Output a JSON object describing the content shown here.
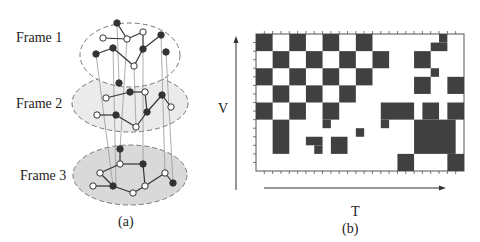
{
  "panel_a": {
    "caption": "(a)",
    "frames": [
      {
        "label": "Frame 1",
        "ellipse": {
          "cx": 130,
          "cy": 55,
          "rx": 50,
          "ry": 32
        },
        "fill": "#ffffff",
        "nodes": [
          [
            117,
            23,
            1
          ],
          [
            103,
            38,
            0
          ],
          [
            127,
            39,
            0
          ],
          [
            143,
            32,
            0
          ],
          [
            161,
            35,
            1
          ],
          [
            96,
            54,
            1
          ],
          [
            113,
            48,
            1
          ],
          [
            143,
            49,
            1
          ],
          [
            134,
            66,
            0
          ],
          [
            166,
            52,
            1
          ]
        ],
        "edges": [
          [
            0,
            2
          ],
          [
            1,
            2
          ],
          [
            2,
            3
          ],
          [
            3,
            7
          ],
          [
            7,
            4
          ],
          [
            5,
            6
          ],
          [
            6,
            8
          ],
          [
            8,
            7
          ]
        ]
      },
      {
        "label": "Frame 2",
        "ellipse": {
          "cx": 130,
          "cy": 103,
          "rx": 58,
          "ry": 29
        },
        "fill": "#ebebeb",
        "nodes": [
          [
            119,
            83,
            1
          ],
          [
            106,
            98,
            0
          ],
          [
            130,
            92,
            1
          ],
          [
            145,
            92,
            0
          ],
          [
            162,
            95,
            1
          ],
          [
            171,
            107,
            0
          ],
          [
            97,
            115,
            0
          ],
          [
            116,
            115,
            1
          ],
          [
            147,
            112,
            1
          ],
          [
            136,
            127,
            0
          ]
        ],
        "edges": [
          [
            1,
            2
          ],
          [
            2,
            3
          ],
          [
            3,
            8
          ],
          [
            8,
            9
          ],
          [
            9,
            7
          ],
          [
            7,
            6
          ],
          [
            8,
            4
          ],
          [
            4,
            5
          ]
        ]
      },
      {
        "label": "Frame 3",
        "ellipse": {
          "cx": 130,
          "cy": 175,
          "rx": 57,
          "ry": 30
        },
        "fill": "#d9d9d9",
        "nodes": [
          [
            120,
            149,
            1
          ],
          [
            120,
            164,
            0
          ],
          [
            143,
            164,
            1
          ],
          [
            100,
            173,
            0
          ],
          [
            165,
            173,
            0
          ],
          [
            145,
            186,
            0
          ],
          [
            173,
            183,
            1
          ],
          [
            93,
            186,
            0
          ],
          [
            113,
            186,
            1
          ],
          [
            133,
            193,
            0
          ]
        ],
        "edges": [
          [
            0,
            1
          ],
          [
            1,
            2
          ],
          [
            1,
            3
          ],
          [
            2,
            5
          ],
          [
            5,
            4
          ],
          [
            4,
            6
          ],
          [
            7,
            8
          ],
          [
            8,
            9
          ],
          [
            9,
            5
          ],
          [
            3,
            8
          ]
        ]
      }
    ],
    "links": [
      [
        96,
        54,
        113,
        186
      ],
      [
        113,
        48,
        116,
        186
      ],
      [
        127,
        39,
        120,
        149
      ],
      [
        143,
        49,
        143,
        164
      ],
      [
        161,
        35,
        165,
        173
      ],
      [
        166,
        52,
        173,
        183
      ],
      [
        117,
        23,
        119,
        83
      ],
      [
        134,
        66,
        136,
        127
      ]
    ]
  },
  "panel_b": {
    "caption": "(b)",
    "x_axis_label": "T",
    "y_axis_label": "V",
    "grid": {
      "x": 256,
      "y": 34,
      "width": 208,
      "height": 137,
      "cols": 25,
      "rows": 16
    },
    "filled_cells": [
      [
        0,
        0,
        2,
        2
      ],
      [
        4,
        0,
        2,
        2
      ],
      [
        8,
        0,
        2,
        2
      ],
      [
        12,
        0,
        2,
        2
      ],
      [
        2,
        2,
        2,
        2
      ],
      [
        6,
        2,
        2,
        2
      ],
      [
        10,
        2,
        2,
        2
      ],
      [
        14,
        2,
        2,
        2
      ],
      [
        0,
        4,
        2,
        2
      ],
      [
        4,
        4,
        2,
        2
      ],
      [
        8,
        4,
        2,
        2
      ],
      [
        12,
        4,
        2,
        2
      ],
      [
        2,
        6,
        2,
        2
      ],
      [
        6,
        6,
        2,
        2
      ],
      [
        10,
        6,
        2,
        2
      ],
      [
        0,
        8,
        2,
        2
      ],
      [
        4,
        8,
        2,
        2
      ],
      [
        8,
        8,
        2,
        2
      ],
      [
        2,
        10,
        2,
        4
      ],
      [
        8,
        10,
        1,
        1
      ],
      [
        6,
        12,
        2,
        1
      ],
      [
        7,
        13,
        1,
        1
      ],
      [
        9,
        12,
        2,
        2
      ],
      [
        12,
        11,
        1,
        1
      ],
      [
        22,
        0,
        1,
        1
      ],
      [
        21,
        1,
        2,
        1
      ],
      [
        19,
        2,
        2,
        2
      ],
      [
        21,
        4,
        1,
        1
      ],
      [
        19,
        5,
        2,
        2
      ],
      [
        23,
        5,
        2,
        2
      ],
      [
        15,
        8,
        4,
        2
      ],
      [
        15,
        10,
        1,
        1
      ],
      [
        20,
        8,
        2,
        2
      ],
      [
        23,
        8,
        2,
        2
      ],
      [
        19,
        10,
        5,
        4
      ],
      [
        17,
        14,
        2,
        2
      ],
      [
        23,
        14,
        2,
        2
      ]
    ],
    "colors": {
      "cell": "#404040",
      "border": "#555555"
    }
  }
}
